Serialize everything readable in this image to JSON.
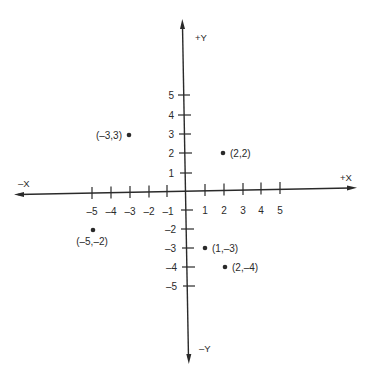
{
  "diagram": {
    "type": "cartesian-coordinate-plane",
    "colors": {
      "ink": "#2a2a2a",
      "background": "#ffffff"
    },
    "axis_labels": {
      "pos_x": "+X",
      "neg_x": "–X",
      "pos_y": "+Y",
      "neg_y": "–Y"
    },
    "x_ticks": [
      {
        "value": -5,
        "label": "–5"
      },
      {
        "value": -4,
        "label": "–4"
      },
      {
        "value": -3,
        "label": "–3"
      },
      {
        "value": -2,
        "label": "–2"
      },
      {
        "value": -1,
        "label": "–1"
      },
      {
        "value": 1,
        "label": "1"
      },
      {
        "value": 2,
        "label": "2"
      },
      {
        "value": 3,
        "label": "3"
      },
      {
        "value": 4,
        "label": "4"
      },
      {
        "value": 5,
        "label": "5"
      }
    ],
    "y_ticks": [
      {
        "value": 5,
        "label": "5"
      },
      {
        "value": 4,
        "label": "4"
      },
      {
        "value": 3,
        "label": "3"
      },
      {
        "value": 2,
        "label": "2"
      },
      {
        "value": 1,
        "label": "1"
      },
      {
        "value": -2,
        "label": "–2"
      },
      {
        "value": -3,
        "label": "–3"
      },
      {
        "value": -4,
        "label": "–4"
      },
      {
        "value": -5,
        "label": "–5"
      }
    ],
    "points": [
      {
        "x": -3,
        "y": 3,
        "label": "(–3,3)",
        "label_position": "left"
      },
      {
        "x": 2,
        "y": 2,
        "label": "(2,2)",
        "label_position": "right"
      },
      {
        "x": -5,
        "y": -2,
        "label": "(–5,–2)",
        "label_position": "below"
      },
      {
        "x": 1,
        "y": -3,
        "label": "(1,–3)",
        "label_position": "right"
      },
      {
        "x": 2,
        "y": -4,
        "label": "(2,–4)",
        "label_position": "right"
      }
    ]
  }
}
